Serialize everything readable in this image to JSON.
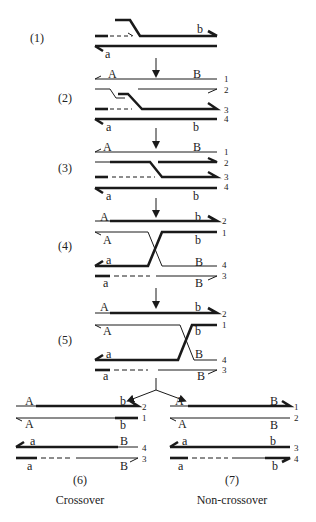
{
  "colors": {
    "ink": "#1a1a1a",
    "background": "#ffffff"
  },
  "steps": [
    {
      "id": "1",
      "label": "(1)",
      "x": 30,
      "y": 42
    },
    {
      "id": "2",
      "label": "(2)",
      "x": 58,
      "y": 102
    },
    {
      "id": "3",
      "label": "(3)",
      "x": 58,
      "y": 172
    },
    {
      "id": "4",
      "label": "(4)",
      "x": 58,
      "y": 250
    },
    {
      "id": "5",
      "label": "(5)",
      "x": 58,
      "y": 344
    }
  ],
  "outcomes": [
    {
      "label": "(6)",
      "caption": "Crossover",
      "x": 80,
      "y1": 484,
      "y2": 504
    },
    {
      "label": "(7)",
      "caption": "Non-crossover",
      "x": 232,
      "y1": 484,
      "y2": 504
    }
  ],
  "alleles": [
    {
      "t": "b",
      "x": 197,
      "y": 33
    },
    {
      "t": "a",
      "x": 105,
      "y": 58
    },
    {
      "t": "A",
      "x": 108,
      "y": 78
    },
    {
      "t": "B",
      "x": 193,
      "y": 78
    },
    {
      "t": "a",
      "x": 106,
      "y": 131
    },
    {
      "t": "b",
      "x": 193,
      "y": 131
    },
    {
      "t": "A",
      "x": 103,
      "y": 151
    },
    {
      "t": "B",
      "x": 193,
      "y": 151
    },
    {
      "t": "a",
      "x": 106,
      "y": 200
    },
    {
      "t": "b",
      "x": 193,
      "y": 200
    },
    {
      "t": "A",
      "x": 100,
      "y": 221
    },
    {
      "t": "b",
      "x": 195,
      "y": 221
    },
    {
      "t": "A",
      "x": 103,
      "y": 244
    },
    {
      "t": "b",
      "x": 195,
      "y": 244
    },
    {
      "t": "a",
      "x": 106,
      "y": 264
    },
    {
      "t": "B",
      "x": 195,
      "y": 266
    },
    {
      "t": "a",
      "x": 103,
      "y": 287
    },
    {
      "t": "B",
      "x": 195,
      "y": 287
    },
    {
      "t": "A",
      "x": 100,
      "y": 311
    },
    {
      "t": "b",
      "x": 195,
      "y": 311
    },
    {
      "t": "A",
      "x": 103,
      "y": 335
    },
    {
      "t": "b",
      "x": 195,
      "y": 335
    },
    {
      "t": "a",
      "x": 106,
      "y": 358
    },
    {
      "t": "B",
      "x": 195,
      "y": 358
    },
    {
      "t": "a",
      "x": 103,
      "y": 380
    },
    {
      "t": "B",
      "x": 197,
      "y": 380
    },
    {
      "t": "A",
      "x": 25,
      "y": 405
    },
    {
      "t": "b",
      "x": 120,
      "y": 405
    },
    {
      "t": "A",
      "x": 25,
      "y": 428
    },
    {
      "t": "b",
      "x": 120,
      "y": 429
    },
    {
      "t": "a",
      "x": 30,
      "y": 445
    },
    {
      "t": "B",
      "x": 120,
      "y": 445
    },
    {
      "t": "a",
      "x": 27,
      "y": 470
    },
    {
      "t": "B",
      "x": 120,
      "y": 470
    },
    {
      "t": "A",
      "x": 175,
      "y": 405
    },
    {
      "t": "B",
      "x": 270,
      "y": 405
    },
    {
      "t": "A",
      "x": 178,
      "y": 428
    },
    {
      "t": "B",
      "x": 270,
      "y": 429
    },
    {
      "t": "a",
      "x": 182,
      "y": 445
    },
    {
      "t": "b",
      "x": 270,
      "y": 445
    },
    {
      "t": "a",
      "x": 178,
      "y": 470
    },
    {
      "t": "b",
      "x": 272,
      "y": 470
    }
  ],
  "strand_numbers": [
    {
      "t": "1",
      "x": 224,
      "y": 82
    },
    {
      "t": "2",
      "x": 224,
      "y": 93
    },
    {
      "t": "3",
      "x": 224,
      "y": 113
    },
    {
      "t": "4",
      "x": 224,
      "y": 122
    },
    {
      "t": "1",
      "x": 224,
      "y": 155
    },
    {
      "t": "2",
      "x": 224,
      "y": 166
    },
    {
      "t": "3",
      "x": 224,
      "y": 180
    },
    {
      "t": "4",
      "x": 224,
      "y": 190
    },
    {
      "t": "2",
      "x": 222,
      "y": 224
    },
    {
      "t": "1",
      "x": 222,
      "y": 236
    },
    {
      "t": "4",
      "x": 222,
      "y": 268
    },
    {
      "t": "3",
      "x": 222,
      "y": 279
    },
    {
      "t": "2",
      "x": 222,
      "y": 317
    },
    {
      "t": "1",
      "x": 222,
      "y": 328
    },
    {
      "t": "4",
      "x": 222,
      "y": 363
    },
    {
      "t": "3",
      "x": 222,
      "y": 373
    },
    {
      "t": "2",
      "x": 142,
      "y": 410
    },
    {
      "t": "1",
      "x": 142,
      "y": 421
    },
    {
      "t": "4",
      "x": 142,
      "y": 451
    },
    {
      "t": "3",
      "x": 142,
      "y": 462
    },
    {
      "t": "1",
      "x": 294,
      "y": 410
    },
    {
      "t": "2",
      "x": 294,
      "y": 421
    },
    {
      "t": "3",
      "x": 294,
      "y": 451
    },
    {
      "t": "4",
      "x": 294,
      "y": 462
    }
  ]
}
